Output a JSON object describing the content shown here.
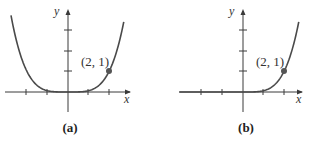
{
  "chart_data": [
    {
      "type": "line",
      "panel": "(a)",
      "title": "",
      "xlabel": "x",
      "ylabel": "y",
      "description": "Even quartic-like curve, flat near origin, symmetric about y-axis",
      "function": "y = x^4/16",
      "x": [
        -2.75,
        -2.5,
        -2,
        -1.5,
        -1,
        -0.5,
        0,
        0.5,
        1,
        1.5,
        2,
        2.5,
        2.7
      ],
      "y": [
        3.57,
        2.44,
        1.0,
        0.32,
        0.06,
        0.004,
        0,
        0.004,
        0.06,
        0.32,
        1.0,
        2.44,
        3.32
      ],
      "highlight_point": {
        "x": 2,
        "y": 1,
        "label": "(2, 1)"
      },
      "x_ticks": [
        -2,
        -1,
        1,
        2
      ],
      "y_ticks": [
        1,
        2,
        3
      ],
      "xlim": [
        -3.3,
        3.3
      ],
      "ylim": [
        -1.1,
        4.5
      ],
      "caption": "(a)"
    },
    {
      "type": "line",
      "panel": "(b)",
      "title": "",
      "xlabel": "x",
      "ylabel": "y",
      "description": "Curve equal to zero for x <= 0, rising steeply for x > 0",
      "function": "y = 0 for x<=0, x^4/16 for x>0",
      "x": [
        -2.8,
        -2,
        -1,
        0,
        0.5,
        1,
        1.5,
        2,
        2.5,
        2.75
      ],
      "y": [
        0,
        0,
        0,
        0,
        0.004,
        0.06,
        0.32,
        1.0,
        2.44,
        3.57
      ],
      "highlight_point": {
        "x": 2,
        "y": 1,
        "label": "(2, 1)"
      },
      "x_ticks": [
        -2,
        -1,
        1,
        2
      ],
      "y_ticks": [
        1,
        2,
        3
      ],
      "xlim": [
        -3.3,
        3.3
      ],
      "ylim": [
        -1.1,
        4.5
      ],
      "caption": "(b)"
    }
  ],
  "panels": {
    "a": {
      "caption": "(a)",
      "point_label": "(2, 1)",
      "x_axis_label": "x",
      "y_axis_label": "y"
    },
    "b": {
      "caption": "(b)",
      "point_label": "(2, 1)",
      "x_axis_label": "x",
      "y_axis_label": "y"
    }
  },
  "style": {
    "axis_color": "#3a3a3a",
    "curve_color": "#4a4a4a",
    "point_color": "#555555"
  }
}
